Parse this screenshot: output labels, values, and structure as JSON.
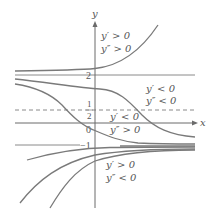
{
  "figure": {
    "axes": {
      "x_label": "x",
      "y_label": "y"
    },
    "reference_lines": {
      "y2_label": "2",
      "half_numerator": "1",
      "half_denominator": "2",
      "origin_label": "0",
      "neg1_label": "−1"
    },
    "regions": [
      {
        "name": "above-2",
        "line1": "y′ > 0",
        "line2": "y″ > 0"
      },
      {
        "name": "between-half-and-2",
        "line1": "y′ < 0",
        "line2": "y″ < 0"
      },
      {
        "name": "between-neg1-and-half",
        "line1": "y′ < 0",
        "line2": "y″ > 0"
      },
      {
        "name": "below-neg1",
        "line1": "y′ > 0",
        "line2": "y″ < 0"
      }
    ],
    "colors": {
      "curve": "#7a7a7a",
      "axis": "#6b6b6b",
      "text": "#555555"
    }
  }
}
